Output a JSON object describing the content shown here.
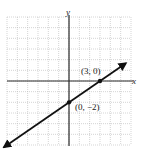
{
  "chart_data": {
    "type": "line",
    "title": "",
    "xlabel": "x",
    "ylabel": "y",
    "xlim": [
      -6,
      6
    ],
    "ylim": [
      -6,
      6
    ],
    "grid": true,
    "grid_style": "dotted",
    "series": [
      {
        "name": "line through (0, -2) and (3, 0)",
        "equation": "y = (2/3)x - 2",
        "slope": 0.6667,
        "intercept": -2,
        "x": [
          -6,
          0,
          3,
          6
        ],
        "y": [
          -6,
          -2,
          0,
          2
        ],
        "arrows": "both"
      }
    ],
    "points": [
      {
        "x": 3,
        "y": 0,
        "label": "(3, 0)"
      },
      {
        "x": 0,
        "y": -2,
        "label": "(0, −2)"
      }
    ],
    "annotations": [
      "(3, 0)",
      "(0, −2)"
    ]
  },
  "labels": {
    "x_axis": "x",
    "y_axis": "y",
    "point_a": "(3, 0)",
    "point_b": "(0, −2)"
  },
  "colors": {
    "axis": "#2a2a2a",
    "grid": "#b8b8b8",
    "line": "#111111",
    "background": "#ffffff"
  }
}
